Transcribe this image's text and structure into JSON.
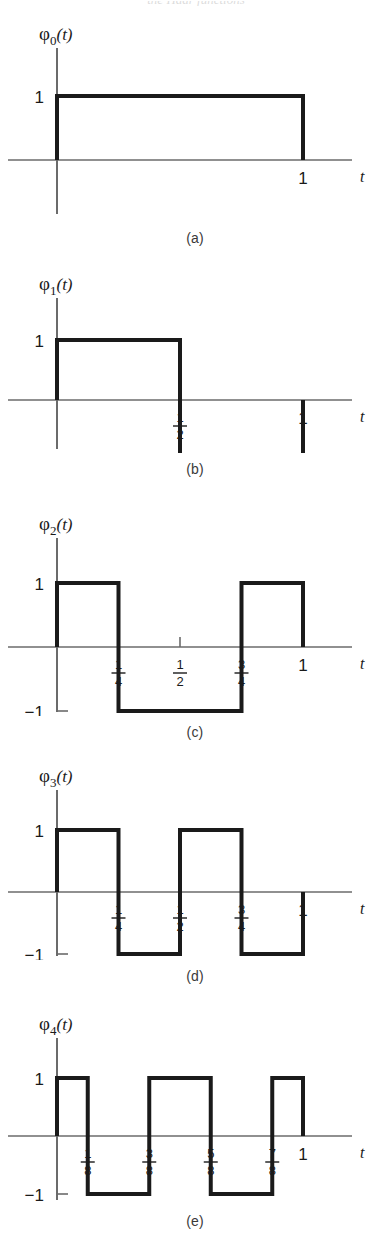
{
  "figure": {
    "background": "#ffffff",
    "wave_color": "#1a1a1a",
    "axis_color": "#6b6b6b",
    "partial_top_text": "the Haar functions"
  },
  "axis_labels": {
    "t_axis": "t",
    "one": "1",
    "minus_one": "−1",
    "phi_symbol": "φ",
    "paren_open": "(",
    "paren_close": ")",
    "arg": "t"
  },
  "chart_data": [
    {
      "type": "line",
      "id": "phi0",
      "title": "φ0(t)",
      "subscript": "0",
      "caption": "(a)",
      "xlabel": "t",
      "ylabel": "",
      "xlim": [
        0,
        1.35
      ],
      "ylim": [
        -1,
        1
      ],
      "y_ticks": [
        1
      ],
      "y_tick_labels": [
        "1"
      ],
      "x_ticks": [
        1
      ],
      "x_tick_labels": [
        "1"
      ],
      "x_tick_fractions": [
        null
      ],
      "segments": [
        {
          "x0": 0,
          "x1": 1,
          "y": 1
        }
      ],
      "x": [
        0,
        0,
        1,
        1
      ],
      "values": [
        0,
        1,
        1,
        0
      ],
      "grid": false,
      "legend": null
    },
    {
      "type": "line",
      "id": "phi1",
      "title": "φ1(t)",
      "subscript": "1",
      "caption": "(b)",
      "xlabel": "t",
      "ylabel": "",
      "xlim": [
        0,
        1.35
      ],
      "ylim": [
        -1,
        1
      ],
      "y_ticks": [
        1,
        -1
      ],
      "y_tick_labels": [
        "1",
        "−1"
      ],
      "x_ticks": [
        0.5,
        1
      ],
      "x_tick_labels": [
        "1/2",
        "1"
      ],
      "x_tick_fractions": [
        {
          "num": "1",
          "den": "2"
        },
        null
      ],
      "segments": [
        {
          "x0": 0,
          "x1": 0.5,
          "y": 1
        },
        {
          "x0": 0.5,
          "x1": 1,
          "y": -1
        }
      ],
      "x": [
        0,
        0,
        0.5,
        0.5,
        1,
        1
      ],
      "values": [
        0,
        1,
        1,
        -1,
        -1,
        0
      ],
      "grid": false,
      "legend": null
    },
    {
      "type": "line",
      "id": "phi2",
      "title": "φ2(t)",
      "subscript": "2",
      "caption": "(c)",
      "xlabel": "t",
      "ylabel": "",
      "xlim": [
        0,
        1.35
      ],
      "ylim": [
        -1,
        1
      ],
      "y_ticks": [
        1,
        -1
      ],
      "y_tick_labels": [
        "1",
        "−1"
      ],
      "x_ticks": [
        0.25,
        0.5,
        0.75,
        1
      ],
      "x_tick_labels": [
        "1/4",
        "1/2",
        "3/4",
        "1"
      ],
      "x_tick_fractions": [
        {
          "num": "1",
          "den": "4"
        },
        {
          "num": "1",
          "den": "2"
        },
        {
          "num": "3",
          "den": "4"
        },
        null
      ],
      "segments": [
        {
          "x0": 0,
          "x1": 0.25,
          "y": 1
        },
        {
          "x0": 0.25,
          "x1": 0.75,
          "y": -1
        },
        {
          "x0": 0.75,
          "x1": 1,
          "y": 1
        }
      ],
      "x": [
        0,
        0,
        0.25,
        0.25,
        0.75,
        0.75,
        1,
        1
      ],
      "values": [
        0,
        1,
        1,
        -1,
        -1,
        1,
        1,
        0
      ],
      "grid": false,
      "legend": null
    },
    {
      "type": "line",
      "id": "phi3",
      "title": "φ3(t)",
      "subscript": "3",
      "caption": "(d)",
      "xlabel": "t",
      "ylabel": "",
      "xlim": [
        0,
        1.35
      ],
      "ylim": [
        -1,
        1
      ],
      "y_ticks": [
        1,
        -1
      ],
      "y_tick_labels": [
        "1",
        "−1"
      ],
      "x_ticks": [
        0.25,
        0.5,
        0.75,
        1
      ],
      "x_tick_labels": [
        "1/4",
        "1/2",
        "3/4",
        "1"
      ],
      "x_tick_fractions": [
        {
          "num": "1",
          "den": "4"
        },
        {
          "num": "1",
          "den": "2"
        },
        {
          "num": "3",
          "den": "4"
        },
        null
      ],
      "segments": [
        {
          "x0": 0,
          "x1": 0.25,
          "y": 1
        },
        {
          "x0": 0.25,
          "x1": 0.5,
          "y": -1
        },
        {
          "x0": 0.5,
          "x1": 0.75,
          "y": 1
        },
        {
          "x0": 0.75,
          "x1": 1,
          "y": -1
        }
      ],
      "x": [
        0,
        0,
        0.25,
        0.25,
        0.5,
        0.5,
        0.75,
        0.75,
        1,
        1
      ],
      "values": [
        0,
        1,
        1,
        -1,
        -1,
        1,
        1,
        -1,
        -1,
        0
      ],
      "grid": false,
      "legend": null
    },
    {
      "type": "line",
      "id": "phi4",
      "title": "φ4(t)",
      "subscript": "4",
      "caption": "(e)",
      "xlabel": "t",
      "ylabel": "",
      "xlim": [
        0,
        1.35
      ],
      "ylim": [
        -1,
        1
      ],
      "y_ticks": [
        1,
        -1
      ],
      "y_tick_labels": [
        "1",
        "−1"
      ],
      "x_ticks": [
        0.125,
        0.375,
        0.625,
        0.875,
        1
      ],
      "x_tick_labels": [
        "1/8",
        "3/8",
        "5/8",
        "7/8",
        "1"
      ],
      "x_tick_fractions": [
        {
          "num": "1",
          "den": "8"
        },
        {
          "num": "3",
          "den": "8"
        },
        {
          "num": "5",
          "den": "8"
        },
        {
          "num": "7",
          "den": "8"
        },
        null
      ],
      "segments": [
        {
          "x0": 0,
          "x1": 0.125,
          "y": 1
        },
        {
          "x0": 0.125,
          "x1": 0.375,
          "y": -1
        },
        {
          "x0": 0.375,
          "x1": 0.625,
          "y": 1
        },
        {
          "x0": 0.625,
          "x1": 0.875,
          "y": -1
        },
        {
          "x0": 0.875,
          "x1": 1,
          "y": 1
        }
      ],
      "x": [
        0,
        0,
        0.125,
        0.125,
        0.375,
        0.375,
        0.625,
        0.625,
        0.875,
        0.875,
        1,
        1
      ],
      "values": [
        0,
        1,
        1,
        -1,
        -1,
        1,
        1,
        -1,
        -1,
        1,
        1,
        0
      ],
      "grid": false,
      "legend": null
    }
  ],
  "panel_layout": [
    {
      "id": "phi0",
      "top": 18,
      "height": 200,
      "caption_y": 230,
      "axis_y": 142,
      "amp": 64,
      "show_minus_one": false,
      "half_tick": false
    },
    {
      "id": "phi1",
      "top": 268,
      "height": 185,
      "caption_y": 461,
      "axis_y": 132,
      "amp": 60,
      "show_minus_one": true,
      "half_tick": false
    },
    {
      "id": "phi2",
      "top": 508,
      "height": 208,
      "caption_y": 724,
      "axis_y": 139,
      "amp": 64,
      "show_minus_one": true,
      "half_tick": true
    },
    {
      "id": "phi3",
      "top": 760,
      "height": 200,
      "caption_y": 968,
      "axis_y": 132,
      "amp": 62,
      "show_minus_one": true,
      "half_tick": false
    },
    {
      "id": "phi4",
      "top": 1008,
      "height": 196,
      "caption_y": 1213,
      "axis_y": 128,
      "amp": 58,
      "show_minus_one": true,
      "half_tick": false
    }
  ]
}
